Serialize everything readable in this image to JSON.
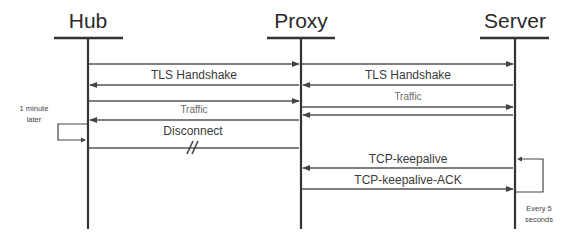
{
  "diagram": {
    "type": "sequence",
    "actors": [
      {
        "id": "hub",
        "label": "Hub"
      },
      {
        "id": "proxy",
        "label": "Proxy"
      },
      {
        "id": "server",
        "label": "Server"
      }
    ],
    "messages": [
      {
        "from": "hub",
        "to": "proxy",
        "label": ""
      },
      {
        "from": "proxy",
        "to": "server",
        "label": ""
      },
      {
        "from": "proxy",
        "to": "hub",
        "label": "TLS Handshake"
      },
      {
        "from": "server",
        "to": "proxy",
        "label": "TLS Handshake"
      },
      {
        "from": "hub",
        "to": "proxy",
        "label": ""
      },
      {
        "from": "proxy",
        "to": "hub",
        "label": "Traffic"
      },
      {
        "from": "proxy",
        "to": "server",
        "label": "Traffic"
      },
      {
        "from": "server",
        "to": "proxy",
        "label": ""
      },
      {
        "from": "hub",
        "to": "proxy",
        "label": "Disconnect",
        "broken": true
      },
      {
        "from": "server",
        "to": "proxy",
        "label": "TCP-keepalive"
      },
      {
        "from": "proxy",
        "to": "server",
        "label": "TCP-keepalive-ACK"
      }
    ],
    "labels": {
      "tls_left": "TLS Handshake",
      "tls_right": "TLS Handshake",
      "traffic_left": "Traffic",
      "traffic_right": "Traffic",
      "disconnect": "Disconnect",
      "keepalive": "TCP-keepalive",
      "keepalive_ack": "TCP-keepalive-ACK"
    },
    "notes": {
      "hub_loop_line1": "1 minute",
      "hub_loop_line2": "later",
      "server_loop_line1": "Every 5",
      "server_loop_line2": "seconds"
    }
  }
}
